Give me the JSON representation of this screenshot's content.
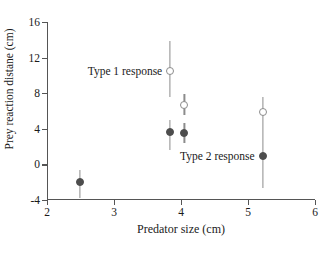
{
  "chart_data": {
    "type": "scatter",
    "title": "",
    "xlabel": "Predator size (cm)",
    "ylabel": "Prey reaction distane (cm)",
    "xlim": [
      2,
      6
    ],
    "ylim": [
      -4,
      16
    ],
    "xticks": [
      "2",
      "3",
      "4",
      "5",
      "6"
    ],
    "yticks": [
      "16",
      "12",
      "8",
      "4",
      "0",
      "-4"
    ],
    "grid": false,
    "legend_position": "none",
    "annotations": [
      {
        "text": "Type 1 response",
        "x": 3.72,
        "y": 10.5
      },
      {
        "text": "Type 2 response",
        "x": 5.1,
        "y": 0.9
      }
    ],
    "series": [
      {
        "name": "Type 1 response",
        "marker": "open-circle",
        "color": "#8c8c8c",
        "points": [
          {
            "x": 3.83,
            "y": 10.5,
            "yerr_low": 7.6,
            "yerr_high": 13.9
          },
          {
            "x": 4.05,
            "y": 6.7,
            "yerr_low": 5.5,
            "yerr_high": 7.9
          },
          {
            "x": 5.22,
            "y": 5.9,
            "yerr_low": 4.0,
            "yerr_high": 7.6
          }
        ]
      },
      {
        "name": "Type 2 response",
        "marker": "filled-circle",
        "color": "#4d4d4d",
        "points": [
          {
            "x": 2.49,
            "y": -2.0,
            "yerr_low": -3.8,
            "yerr_high": -0.6
          },
          {
            "x": 3.83,
            "y": 3.6,
            "yerr_low": 1.6,
            "yerr_high": 5.0
          },
          {
            "x": 4.05,
            "y": 3.5,
            "yerr_low": 2.4,
            "yerr_high": 4.6
          },
          {
            "x": 5.22,
            "y": 0.9,
            "yerr_low": -2.6,
            "yerr_high": 4.0
          }
        ]
      }
    ]
  }
}
